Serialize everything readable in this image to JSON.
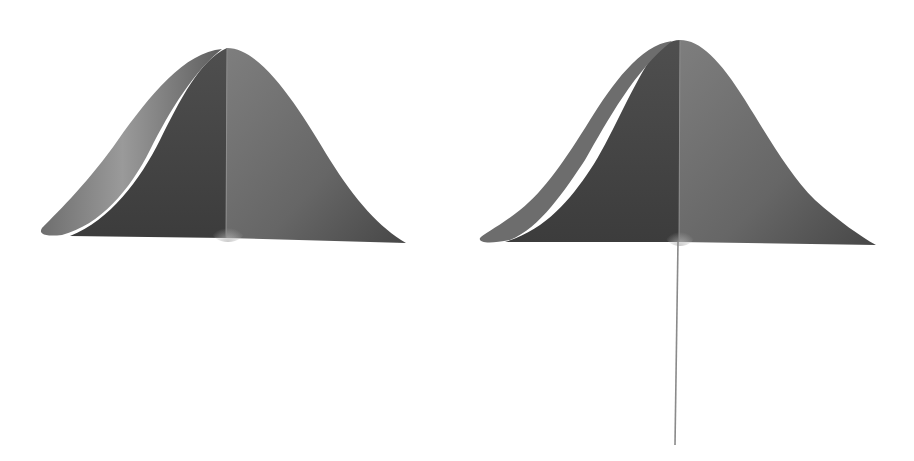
{
  "figure": {
    "colors": {
      "background": "#ffffff",
      "surface_dark": "#4a4a4a",
      "surface_mid": "#6a6a6a",
      "surface_light": "#9a9a9a",
      "stem": "#8a8a8a"
    },
    "shapes": [
      {
        "id": "left-bell",
        "has_stem": false
      },
      {
        "id": "right-bell",
        "has_stem": true
      }
    ]
  }
}
